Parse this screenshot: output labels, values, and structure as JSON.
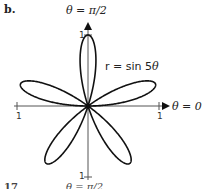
{
  "panel_label": "b.",
  "footer": {
    "label": "17",
    "partial_text": "θ = π/2"
  },
  "chart_data": {
    "type": "line",
    "subtype": "polar",
    "title": "",
    "equation": "r = sin 5θ",
    "polar_axis_labels": {
      "vertical": "θ = π/2",
      "horizontal": "θ = 0"
    },
    "tick_labels": {
      "top": "1",
      "bottom": "1",
      "left": "1",
      "right": "1"
    },
    "rlim": [
      0,
      1
    ],
    "petals": 5,
    "petal_tip_angles_deg": [
      18,
      90,
      162,
      234,
      306
    ],
    "grid": false,
    "legend": null
  },
  "labels": {
    "top_axis": "θ = π/2",
    "right_axis": "θ = 0",
    "curve_eq_prefix": "r = sin 5",
    "curve_eq_var": "θ",
    "tick_top": "1",
    "tick_bottom": "1",
    "tick_left": "1",
    "tick_right": "1"
  }
}
